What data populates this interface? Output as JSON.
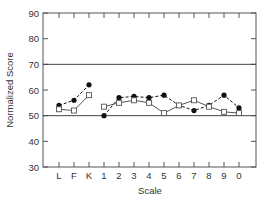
{
  "chart_data": {
    "type": "line",
    "title": "",
    "xlabel": "Scale",
    "ylabel": "Normalized Score",
    "ylim": [
      30,
      90
    ],
    "yticks": [
      30,
      40,
      50,
      60,
      70,
      80,
      90
    ],
    "reference_lines": [
      50,
      70
    ],
    "grid": false,
    "legend": null,
    "categories": [
      "L",
      "F",
      "K",
      "1",
      "2",
      "3",
      "4",
      "5",
      "6",
      "7",
      "8",
      "9",
      "0"
    ],
    "segments": [
      [
        "L",
        "F",
        "K"
      ],
      [
        "1",
        "2",
        "3",
        "4",
        "5",
        "6",
        "7",
        "8",
        "9",
        "0"
      ]
    ],
    "series": [
      {
        "name": "filled-circle",
        "marker": "filled-circle",
        "line_style": "dashed",
        "values": [
          54,
          56,
          62,
          50,
          57,
          57.5,
          57,
          58,
          54,
          52,
          54,
          58,
          53
        ]
      },
      {
        "name": "open-square",
        "marker": "open-square",
        "line_style": "solid",
        "values": [
          52.5,
          52,
          58,
          53.5,
          55,
          56,
          55,
          51,
          54,
          56,
          53.5,
          51.5,
          51
        ]
      }
    ]
  },
  "colors": {
    "axis": "#555555",
    "ref_line": "#444444",
    "filled_series": "#111111",
    "open_series": "#555555"
  }
}
